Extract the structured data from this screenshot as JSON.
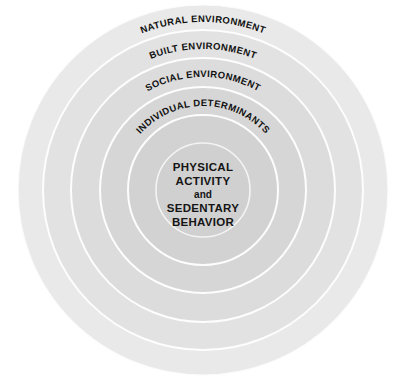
{
  "diagram": {
    "type": "concentric-rings",
    "canvas": {
      "width": 406,
      "height": 383,
      "background": "#ffffff"
    },
    "center": {
      "x": 203,
      "y": 190
    },
    "rings": [
      {
        "id": "natural-environment",
        "label": "NATURAL ENVIRONMENT",
        "level": 1,
        "outer_radius": 185,
        "inner_radius": 160,
        "fill": "#e9e9e9",
        "stroke": "#fdfdfd",
        "label_font_size": 9.5,
        "label_radius": 168
      },
      {
        "id": "built-environment",
        "label": "BUILT ENVIRONMENT",
        "level": 2,
        "outer_radius": 160,
        "inner_radius": 132,
        "fill": "#e2e2e2",
        "stroke": "#fdfdfd",
        "label_font_size": 9.5,
        "label_radius": 141
      },
      {
        "id": "social-environment",
        "label": "SOCIAL ENVIRONMENT",
        "level": 3,
        "outer_radius": 132,
        "inner_radius": 103,
        "fill": "#dcdcdc",
        "stroke": "#fdfdfd",
        "label_font_size": 9.5,
        "label_radius": 113
      },
      {
        "id": "individual-determinants",
        "label": "INDIVIDUAL DETERMINANTS",
        "level": 4,
        "outer_radius": 103,
        "inner_radius": 75,
        "fill": "#d6d6d6",
        "stroke": "#fdfdfd",
        "label_font_size": 9.5,
        "label_radius": 84
      },
      {
        "id": "inner-transition",
        "label": "",
        "level": 5,
        "outer_radius": 75,
        "inner_radius": 47,
        "fill": "#d2d2d2",
        "stroke": "#fdfdfd",
        "label_font_size": 0,
        "label_radius": 0
      }
    ],
    "core": {
      "id": "core-circle",
      "radius": 47,
      "fill": "#d0d0d0",
      "stroke": "#f4f4f4",
      "lines": [
        {
          "text": "PHYSICAL",
          "emphasis": "strong"
        },
        {
          "text": "ACTIVITY",
          "emphasis": "strong"
        },
        {
          "text": "and",
          "emphasis": "normal"
        },
        {
          "text": "SEDENTARY",
          "emphasis": "strong"
        },
        {
          "text": "BEHAVIOR",
          "emphasis": "strong"
        }
      ]
    },
    "colors": {
      "text": "#151515",
      "separator": "#fdfdfd",
      "background": "#ffffff"
    }
  }
}
